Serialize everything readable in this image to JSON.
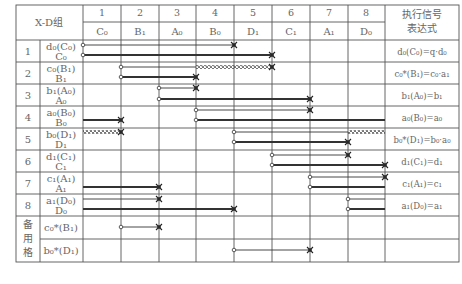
{
  "table": {
    "title_cell": "X-D组",
    "expression_header": [
      "执行信号",
      "表达式"
    ],
    "columns": [
      {
        "num": "1",
        "label": "C₀"
      },
      {
        "num": "2",
        "label": "B₁"
      },
      {
        "num": "3",
        "label": "A₀"
      },
      {
        "num": "4",
        "label": "B₀"
      },
      {
        "num": "5",
        "label": "D₁"
      },
      {
        "num": "6",
        "label": "C₁"
      },
      {
        "num": "7",
        "label": "A₁"
      },
      {
        "num": "8",
        "label": "D₀"
      }
    ],
    "rows": [
      {
        "index": "1",
        "signal": "d₀(C₀)",
        "action": "C₀",
        "expression": "d₀(C₀)=q·d₀"
      },
      {
        "index": "2",
        "signal": "c₀(B₁)",
        "action": "B₁",
        "expression": "c₀*(B₁)=c₀·a₁"
      },
      {
        "index": "3",
        "signal": "b₁(A₀)",
        "action": "A₀",
        "expression": "b₁(A₀)=b₁"
      },
      {
        "index": "4",
        "signal": "a₀(B₀)",
        "action": "B₀",
        "expression": "a₀(B₀)=a₀"
      },
      {
        "index": "5",
        "signal": "b₀(D₁)",
        "action": "D₁",
        "expression": "b₀*(D₁)=b₀·a₀"
      },
      {
        "index": "6",
        "signal": "d₁(C₁)",
        "action": "C₁",
        "expression": "d₁(C₁)=d₁"
      },
      {
        "index": "7",
        "signal": "c₁(A₁)",
        "action": "A₁",
        "expression": "c₁(A₁)=c₁"
      },
      {
        "index": "8",
        "signal": "a₁(D₀)",
        "action": "D₀",
        "expression": "a₁(D₀)=a₁"
      }
    ],
    "spare": {
      "label": [
        "备",
        "用",
        "格"
      ],
      "rows": [
        {
          "signal": "c₀*(B₁)"
        },
        {
          "signal": "b₀*(D₁)"
        }
      ]
    }
  }
}
